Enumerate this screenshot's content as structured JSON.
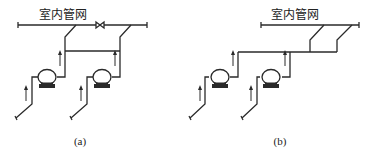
{
  "diagrams": [
    {
      "id": "a",
      "header_label": "室内管网",
      "caption": "(a)",
      "description": "Two pumps each with own branch to indoor network; interconnecting header between discharges; valve on main pipe between branches"
    },
    {
      "id": "b",
      "header_label": "室内管网",
      "caption": "(b)",
      "description": "Two pumps discharge into common horizontal header which connects to indoor network by two branches"
    }
  ],
  "colors": {
    "line": "#2a2a2a",
    "background": "#ffffff"
  }
}
